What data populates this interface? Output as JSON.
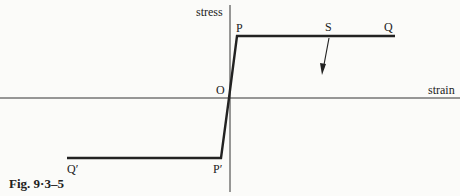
{
  "figure": {
    "caption": "Fig. 9·3–5",
    "axes": {
      "y_label": "stress",
      "x_label": "strain"
    },
    "points": {
      "origin": "O",
      "P": "P",
      "S": "S",
      "Q": "Q",
      "P_prime": "P′",
      "Q_prime": "Q′"
    },
    "colors": {
      "ink": "#222222",
      "background": "#fbfbf9"
    }
  }
}
